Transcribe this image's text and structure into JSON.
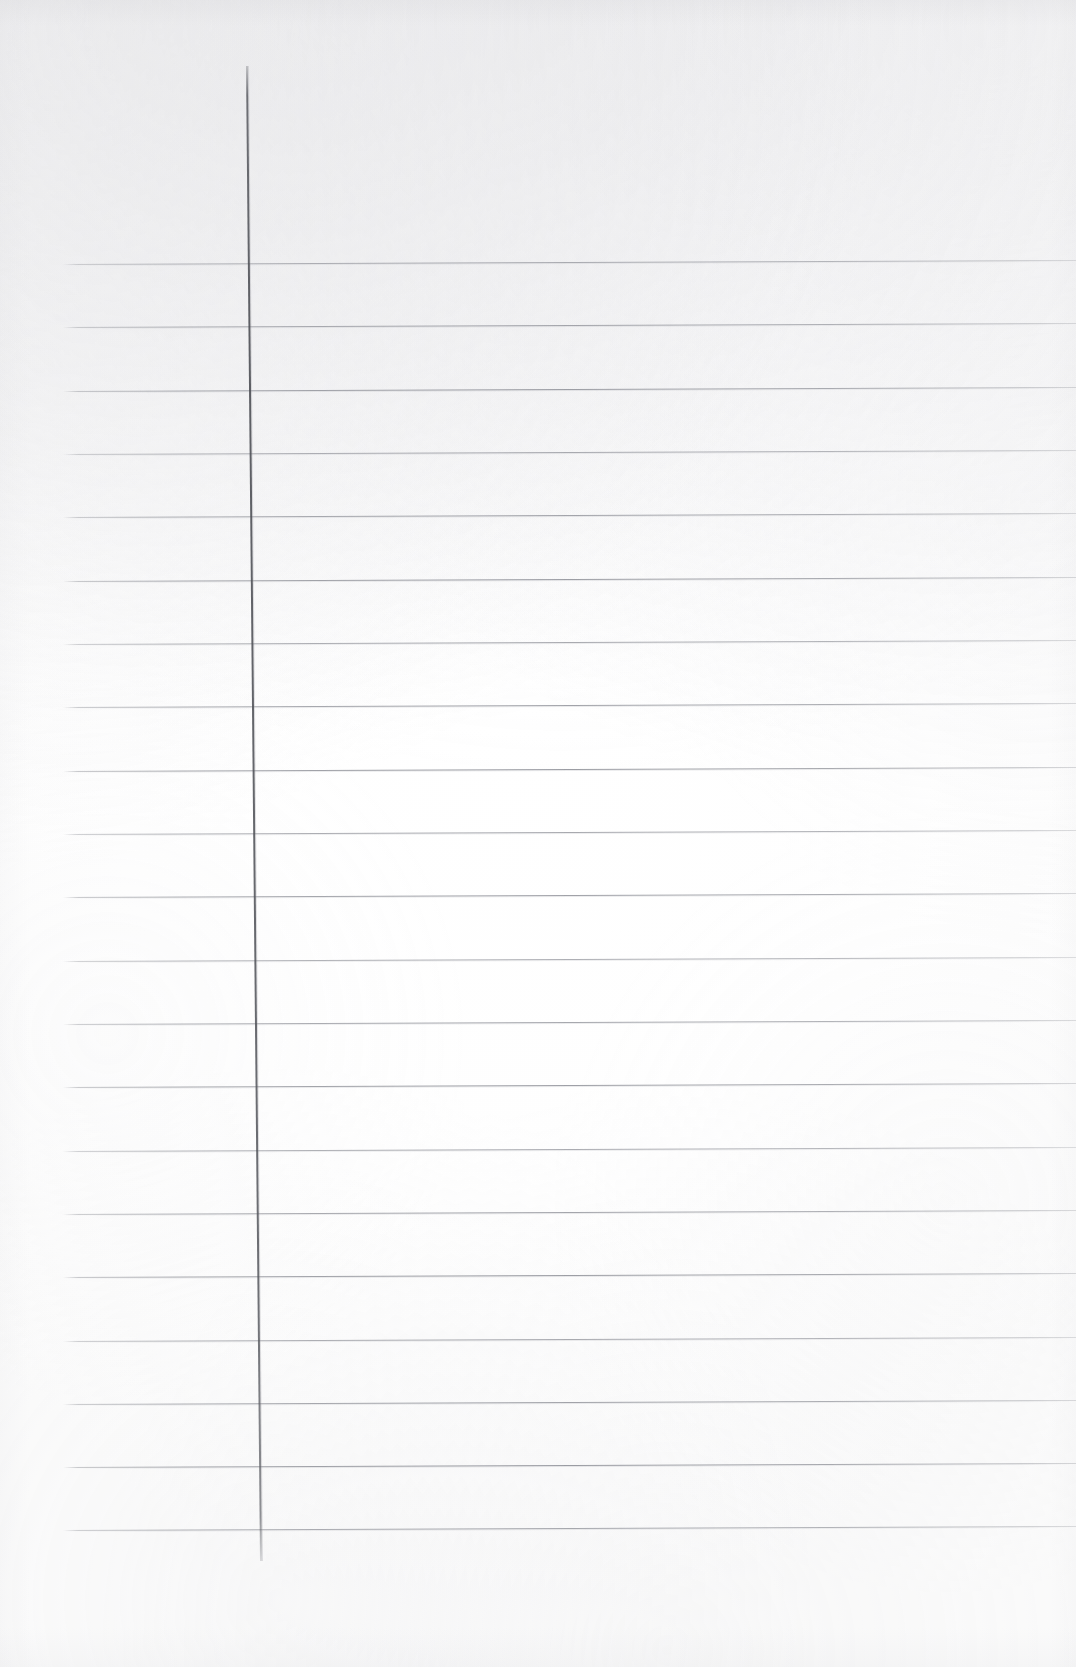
{
  "document": {
    "type": "scanned-ruled-notebook-page",
    "title": "Blank ruled notebook page",
    "page_width": 1076,
    "page_height": 1667,
    "background_color": "#fdfdfd",
    "content_text": "",
    "visible_text_items": []
  },
  "ruling": {
    "horizontal": {
      "count": 21,
      "color": "#8a8c93",
      "thickness_px": 1,
      "left_x": 63,
      "right_x": 1076,
      "first_y": 264,
      "spacing_px": 63.3,
      "y_positions": [
        264,
        327,
        391,
        454,
        517,
        581,
        644,
        707,
        771,
        834,
        897,
        961,
        1024,
        1087,
        1151,
        1214,
        1277,
        1341,
        1404,
        1467,
        1530
      ],
      "slant_deg": -0.22
    },
    "vertical_margin": {
      "count": 1,
      "color": "#50525a",
      "thickness_px": 2,
      "top_y": 66,
      "bottom_y": 1561,
      "top_x": 246,
      "bottom_x": 260,
      "slant_deg": 0.54
    }
  }
}
